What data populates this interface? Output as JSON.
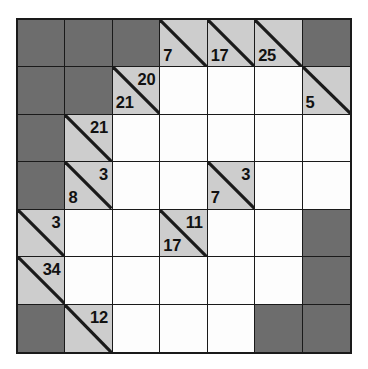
{
  "puzzle": {
    "type": "kakuro",
    "rows": 7,
    "cols": 7,
    "colors": {
      "block": "#6d6d6d",
      "clue": "#cdcdcd",
      "entry": "#fdfdfd",
      "line": "#1a1a1a",
      "text": "#111111"
    },
    "cells": [
      [
        {
          "kind": "block"
        },
        {
          "kind": "block"
        },
        {
          "kind": "block"
        },
        {
          "kind": "clue",
          "down": "7"
        },
        {
          "kind": "clue",
          "down": "17"
        },
        {
          "kind": "clue",
          "down": "25"
        },
        {
          "kind": "block"
        }
      ],
      [
        {
          "kind": "block"
        },
        {
          "kind": "block"
        },
        {
          "kind": "clue",
          "down": "21",
          "across": "20"
        },
        {
          "kind": "entry"
        },
        {
          "kind": "entry"
        },
        {
          "kind": "entry"
        },
        {
          "kind": "clue",
          "down": "5"
        }
      ],
      [
        {
          "kind": "block"
        },
        {
          "kind": "clue",
          "across": "21"
        },
        {
          "kind": "entry"
        },
        {
          "kind": "entry"
        },
        {
          "kind": "entry"
        },
        {
          "kind": "entry"
        },
        {
          "kind": "entry"
        }
      ],
      [
        {
          "kind": "block"
        },
        {
          "kind": "clue",
          "down": "8",
          "across": "3"
        },
        {
          "kind": "entry"
        },
        {
          "kind": "entry"
        },
        {
          "kind": "clue",
          "down": "7",
          "across": "3"
        },
        {
          "kind": "entry"
        },
        {
          "kind": "entry"
        }
      ],
      [
        {
          "kind": "clue",
          "across": "3"
        },
        {
          "kind": "entry"
        },
        {
          "kind": "entry"
        },
        {
          "kind": "clue",
          "down": "17",
          "across": "11"
        },
        {
          "kind": "entry"
        },
        {
          "kind": "entry"
        },
        {
          "kind": "block"
        }
      ],
      [
        {
          "kind": "clue",
          "across": "34"
        },
        {
          "kind": "entry"
        },
        {
          "kind": "entry"
        },
        {
          "kind": "entry"
        },
        {
          "kind": "entry"
        },
        {
          "kind": "entry"
        },
        {
          "kind": "block"
        }
      ],
      [
        {
          "kind": "block"
        },
        {
          "kind": "clue",
          "across": "12"
        },
        {
          "kind": "entry"
        },
        {
          "kind": "entry"
        },
        {
          "kind": "entry"
        },
        {
          "kind": "block"
        },
        {
          "kind": "block"
        }
      ]
    ]
  }
}
